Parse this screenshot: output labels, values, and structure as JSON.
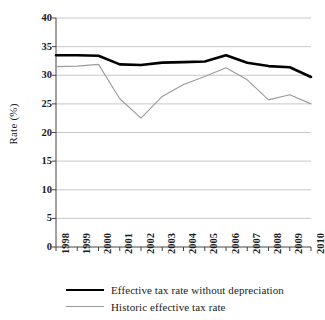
{
  "chart_data": {
    "type": "line",
    "title": "",
    "xlabel": "",
    "ylabel": "Rate (%)",
    "categories": [
      "1998",
      "1999",
      "2000",
      "2001",
      "2002",
      "2003",
      "2004",
      "2005",
      "2006",
      "2007",
      "2008",
      "2009",
      "2010"
    ],
    "ylim": [
      0,
      40
    ],
    "yticks": [
      0,
      5,
      10,
      15,
      20,
      25,
      30,
      35,
      40
    ],
    "grid": true,
    "legend_position": "bottom",
    "series": [
      {
        "name": "Effective tax rate without depreciation",
        "color": "#000000",
        "style": "solid",
        "width": 2.6,
        "values": [
          33.5,
          33.5,
          33.4,
          31.9,
          31.8,
          32.2,
          32.3,
          32.4,
          33.5,
          32.2,
          31.6,
          31.4,
          29.7
        ]
      },
      {
        "name": "Historic effective tax rate",
        "color": "#9a9a9a",
        "style": "solid-thin",
        "width": 1.1,
        "values": [
          31.5,
          31.6,
          31.9,
          25.9,
          22.5,
          26.3,
          28.4,
          29.8,
          31.3,
          29.2,
          25.7,
          26.6,
          25.0
        ]
      }
    ]
  },
  "axis": {
    "ytick_labels": [
      "40",
      "35",
      "30",
      "25",
      "20",
      "15",
      "10",
      "5",
      "0"
    ]
  },
  "legend": {
    "items": [
      {
        "label": "Effective tax rate without depreciation"
      },
      {
        "label": "Historic effective tax rate"
      }
    ]
  }
}
